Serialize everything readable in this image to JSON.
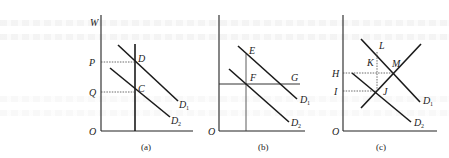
{
  "panels": [
    {
      "id": "a",
      "caption": "(a)",
      "y_axis_label": "W",
      "origin_label": "O",
      "price_labels": [
        "P",
        "Q"
      ],
      "point_labels": [
        "D",
        "C"
      ],
      "curves": [
        {
          "name": "D",
          "sub": "1"
        },
        {
          "name": "D",
          "sub": "2"
        }
      ]
    },
    {
      "id": "b",
      "caption": "(b)",
      "origin_label": "O",
      "point_labels": [
        "E",
        "F",
        "G"
      ],
      "curves": [
        {
          "name": "D",
          "sub": "1"
        },
        {
          "name": "D",
          "sub": "2"
        }
      ]
    },
    {
      "id": "c",
      "caption": "(c)",
      "origin_label": "O",
      "price_labels": [
        "H",
        "I"
      ],
      "point_labels": [
        "L",
        "K",
        "M",
        "J"
      ],
      "curves": [
        {
          "name": "D",
          "sub": "1"
        },
        {
          "name": "D",
          "sub": "2"
        }
      ]
    }
  ]
}
